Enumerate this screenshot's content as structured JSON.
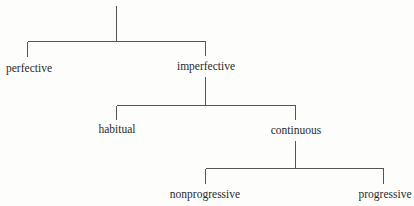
{
  "diagram": {
    "type": "tree",
    "line_color": "#555555",
    "text_color": "#2a2a2a",
    "nodes": [
      {
        "id": "root",
        "label": ""
      },
      {
        "id": "perfective",
        "label": "perfective",
        "parent": "root"
      },
      {
        "id": "imperfective",
        "label": "imperfective",
        "parent": "root"
      },
      {
        "id": "habitual",
        "label": "habitual",
        "parent": "imperfective"
      },
      {
        "id": "continuous",
        "label": "continuous",
        "parent": "imperfective"
      },
      {
        "id": "nonprogressive",
        "label": "nonprogressive",
        "parent": "continuous"
      },
      {
        "id": "progressive",
        "label": "progressive",
        "parent": "continuous"
      }
    ],
    "labels": {
      "perfective": "perfective",
      "imperfective": "imperfective",
      "habitual": "habitual",
      "continuous": "continuous",
      "nonprogressive": "nonprogressive",
      "progressive": "progressive"
    }
  }
}
